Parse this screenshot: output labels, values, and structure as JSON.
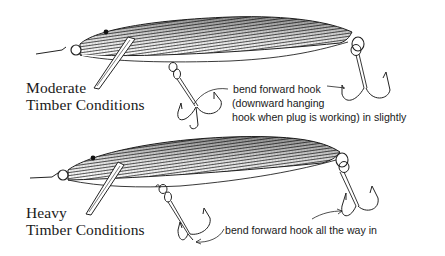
{
  "figure": {
    "background": "#ffffff",
    "ink_color": "#1a1a1a"
  },
  "panels": [
    {
      "id": "moderate",
      "condition_label": {
        "line1": "Moderate",
        "line2": "Timber Conditions"
      },
      "annotation": {
        "line1": "bend forward hook",
        "line2": "(downward hanging",
        "line3": "hook when plug is working) in slightly"
      }
    },
    {
      "id": "heavy",
      "condition_label": {
        "line1": "Heavy",
        "line2": "Timber Conditions"
      },
      "annotation": {
        "line1": "bend forward hook all the way in"
      }
    }
  ]
}
